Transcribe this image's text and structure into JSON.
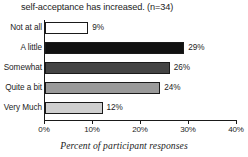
{
  "chart_data": {
    "type": "bar",
    "orientation": "horizontal",
    "title": "self-acceptance has increased. (n=34)",
    "xlabel": "Percent of participant responses",
    "ylabel": "",
    "xlim": [
      0,
      40
    ],
    "grid": false,
    "legend": "none",
    "categories": [
      "Not at all",
      "A little",
      "Somewhat",
      "Quite a bit",
      "Very Much"
    ],
    "values": [
      9,
      29,
      26,
      24,
      12
    ],
    "value_labels": [
      "9%",
      "29%",
      "26%",
      "24%",
      "12%"
    ],
    "bar_colors": [
      "#ffffff",
      "#111111",
      "#444444",
      "#9a9a9a",
      "#cfcfcf"
    ],
    "bar_border_color": "#1a1a1a",
    "xticks": [
      0,
      10,
      20,
      30,
      40
    ],
    "xtick_labels": [
      "0%",
      "10%",
      "20%",
      "30%",
      "40%"
    ]
  }
}
